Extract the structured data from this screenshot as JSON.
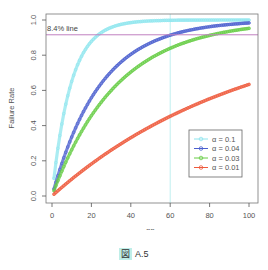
{
  "chart_data": {
    "type": "line",
    "title": "",
    "xlabel": "nn",
    "ylabel": "Failure Rate",
    "xlim": [
      0,
      100
    ],
    "ylim": [
      0,
      1
    ],
    "xticks": [
      0,
      20,
      40,
      60,
      80,
      100
    ],
    "yticks": [
      "0.0",
      "0.2",
      "0.4",
      "0.6",
      "0.8",
      "1.0"
    ],
    "grid": false,
    "legend_position": "lower right (inside)",
    "formula": "1 - (1 - alpha)^n",
    "series": [
      {
        "name": "α = 0.1",
        "alpha": 0.1,
        "color": "#8ee5ee",
        "marker": "triangle",
        "x": [
          1,
          5,
          10,
          15,
          20,
          25,
          30,
          40,
          50,
          60,
          70,
          80,
          90,
          100
        ],
        "values": [
          0.1,
          0.41,
          0.651,
          0.794,
          0.878,
          0.928,
          0.958,
          0.985,
          0.995,
          0.998,
          0.999,
          1.0,
          1.0,
          1.0
        ]
      },
      {
        "name": "α = 0.04",
        "alpha": 0.04,
        "color": "#4b5fcf",
        "marker": "circle",
        "x": [
          1,
          5,
          10,
          15,
          20,
          25,
          30,
          40,
          50,
          60,
          70,
          80,
          90,
          100
        ],
        "values": [
          0.04,
          0.185,
          0.335,
          0.458,
          0.558,
          0.64,
          0.706,
          0.805,
          0.87,
          0.914,
          0.943,
          0.962,
          0.975,
          0.983
        ]
      },
      {
        "name": "α = 0.03",
        "alpha": 0.03,
        "color": "#66cc44",
        "marker": "plus",
        "x": [
          1,
          5,
          10,
          15,
          20,
          25,
          30,
          40,
          50,
          60,
          70,
          80,
          90,
          100
        ],
        "values": [
          0.03,
          0.141,
          0.263,
          0.367,
          0.456,
          0.533,
          0.599,
          0.704,
          0.782,
          0.839,
          0.882,
          0.913,
          0.936,
          0.952
        ]
      },
      {
        "name": "α = 0.01",
        "alpha": 0.01,
        "color": "#ee5a3c",
        "marker": "cross",
        "x": [
          1,
          5,
          10,
          15,
          20,
          25,
          30,
          40,
          50,
          60,
          70,
          80,
          90,
          100
        ],
        "values": [
          0.01,
          0.049,
          0.096,
          0.14,
          0.182,
          0.222,
          0.26,
          0.331,
          0.395,
          0.453,
          0.505,
          0.552,
          0.595,
          0.634
        ]
      }
    ],
    "annotations": [
      {
        "type": "hline",
        "y": 0.916,
        "label": "8.4% line",
        "color": "#c080c0"
      },
      {
        "type": "vline",
        "x": 60,
        "color": "#bfeff0"
      }
    ]
  },
  "caption": {
    "prefix": "図",
    "label": "A.5"
  }
}
